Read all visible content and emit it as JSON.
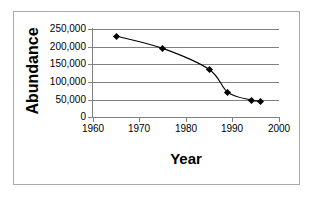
{
  "chart_data": {
    "type": "line",
    "title": "",
    "xlabel": "Year",
    "ylabel": "Abundance",
    "x": [
      1965,
      1975,
      1985,
      1989,
      1994,
      1996
    ],
    "values": [
      230000,
      195000,
      135000,
      70000,
      48000,
      45000
    ],
    "series": [
      {
        "name": "Abundance",
        "x": [
          1965,
          1975,
          1985,
          1989,
          1994,
          1996
        ],
        "values": [
          230000,
          195000,
          135000,
          70000,
          48000,
          45000
        ]
      }
    ],
    "xlim": [
      1960,
      2000
    ],
    "ylim": [
      0,
      250000
    ],
    "xticks": [
      1960,
      1970,
      1980,
      1990,
      2000
    ],
    "yticks": [
      0,
      50000,
      100000,
      150000,
      200000,
      250000
    ],
    "xtick_labels": [
      "1960",
      "1970",
      "1980",
      "1990",
      "2000"
    ],
    "ytick_labels": [
      "0",
      "50,000",
      "100,000",
      "150,000",
      "200,000",
      "250,000"
    ],
    "grid": "horizontal",
    "legend": "none",
    "marker": "diamond",
    "line_color": "#000000",
    "marker_color": "#000000",
    "grid_color": "#808080",
    "background": "#ffffff"
  },
  "axes": {
    "y_title": "Abundance",
    "x_title": "Year",
    "y_tick_labels": [
      "250,000",
      "200,000",
      "150,000",
      "100,000",
      "50,000",
      "0"
    ],
    "x_tick_labels": [
      "1960",
      "1970",
      "1980",
      "1990",
      "2000"
    ]
  }
}
